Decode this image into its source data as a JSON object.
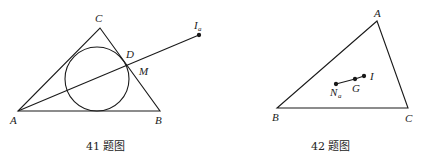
{
  "figures": [
    {
      "caption": "41 题图",
      "labels": {
        "A": "A",
        "B": "B",
        "C": "C",
        "D": "D",
        "M": "M",
        "I": "I",
        "I_sub": "a"
      },
      "description": "Triangle ABC with incircle; line from A through D to excenter I_a, M on BC"
    },
    {
      "caption": "42 题图",
      "labels": {
        "A": "A",
        "B": "B",
        "C": "C",
        "N": "N",
        "N_sub": "a",
        "G": "G",
        "I": "I"
      },
      "description": "Triangle ABC with collinear points N_a, G, I"
    }
  ],
  "colors": {
    "stroke": "#1a1a1a",
    "text": "#222222"
  }
}
